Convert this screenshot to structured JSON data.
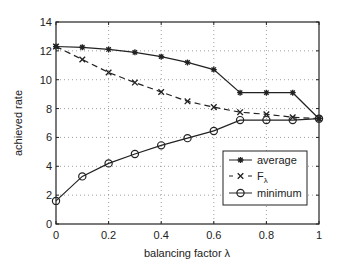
{
  "chart_data": {
    "type": "line",
    "title": "",
    "xlabel": "balancing factor λ",
    "ylabel": "achieved rate",
    "xlim": [
      0,
      1
    ],
    "ylim": [
      0,
      14
    ],
    "grid": true,
    "legend_position": "lower right",
    "x": [
      0,
      0.1,
      0.2,
      0.3,
      0.4,
      0.5,
      0.6,
      0.7,
      0.8,
      0.9,
      1.0
    ],
    "x_ticks": [
      "0",
      "0.2",
      "0.4",
      "0.6",
      "0.8",
      "1"
    ],
    "y_ticks": [
      "0",
      "2",
      "4",
      "6",
      "8",
      "10",
      "12",
      "14"
    ],
    "series": [
      {
        "name": "average",
        "marker": "asterisk",
        "line": "solid",
        "values": [
          12.3,
          12.25,
          12.1,
          11.9,
          11.6,
          11.2,
          10.7,
          9.1,
          9.1,
          9.1,
          7.3
        ]
      },
      {
        "name": "F_λ",
        "marker": "x",
        "line": "dashed",
        "values": [
          12.3,
          11.4,
          10.5,
          9.8,
          9.15,
          8.5,
          8.1,
          7.75,
          7.6,
          7.4,
          7.3
        ]
      },
      {
        "name": "minimum",
        "marker": "circle",
        "line": "solid",
        "values": [
          1.6,
          3.3,
          4.2,
          4.85,
          5.45,
          5.95,
          6.45,
          7.2,
          7.2,
          7.2,
          7.3
        ]
      }
    ]
  },
  "legend": {
    "items": [
      {
        "label": "average"
      },
      {
        "label": "F",
        "sub": "λ"
      },
      {
        "label": "minimum"
      }
    ]
  }
}
